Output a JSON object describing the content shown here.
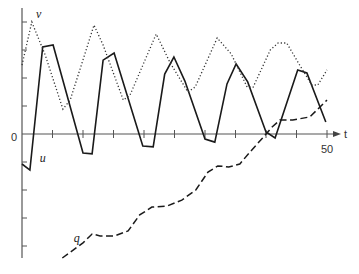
{
  "chart_data": {
    "type": "line",
    "title": "",
    "xlabel": "t",
    "ylabel": "",
    "xlim": [
      0,
      52
    ],
    "ylim": [
      -4.5,
      4.5
    ],
    "x_ticks": [
      5,
      10,
      15,
      20,
      25,
      30,
      35,
      40,
      45,
      50
    ],
    "x_tick_labels": [
      {
        "value": 50,
        "label": "50"
      }
    ],
    "y_ticks": [
      -4,
      -3,
      -2,
      -1,
      1,
      2,
      3,
      4
    ],
    "origin_label": "0",
    "grid": false,
    "legend": "inline labels",
    "series": [
      {
        "name": "u",
        "style": "solid",
        "label_at": [
          2.9,
          -1.0
        ],
        "points": [
          [
            0,
            -1.07
          ],
          [
            1.3,
            -1.29
          ],
          [
            3.4,
            3.11
          ],
          [
            5.1,
            3.18
          ],
          [
            10,
            -0.68
          ],
          [
            11.5,
            -0.71
          ],
          [
            13.3,
            2.64
          ],
          [
            15.1,
            2.89
          ],
          [
            19.8,
            -0.43
          ],
          [
            21.5,
            -0.46
          ],
          [
            23.4,
            2.14
          ],
          [
            24.9,
            2.75
          ],
          [
            26.7,
            1.89
          ],
          [
            30,
            -0.18
          ],
          [
            31.6,
            -0.29
          ],
          [
            33.6,
            1.79
          ],
          [
            35.1,
            2.5
          ],
          [
            37,
            1.86
          ],
          [
            40,
            0.07
          ],
          [
            41.5,
            -0.14
          ],
          [
            45.2,
            2.29
          ],
          [
            46.7,
            2.18
          ],
          [
            49.8,
            0.43
          ]
        ]
      },
      {
        "name": "v",
        "style": "dotted",
        "label_at": [
          2.3,
          4.15
        ],
        "points": [
          [
            0,
            2.46
          ],
          [
            1.6,
            4.0
          ],
          [
            3.8,
            2.82
          ],
          [
            6.7,
            0.89
          ],
          [
            7.9,
            1.21
          ],
          [
            11.8,
            3.89
          ],
          [
            13.3,
            3.18
          ],
          [
            16.6,
            1.21
          ],
          [
            17.7,
            1.39
          ],
          [
            22,
            3.57
          ],
          [
            24.3,
            2.54
          ],
          [
            27.2,
            1.5
          ],
          [
            28.4,
            1.68
          ],
          [
            32,
            3.43
          ],
          [
            34.3,
            2.86
          ],
          [
            36.9,
            1.68
          ],
          [
            37.9,
            1.68
          ],
          [
            40.7,
            3.0
          ],
          [
            42,
            3.25
          ],
          [
            43.4,
            3.25
          ],
          [
            45.6,
            2.43
          ],
          [
            47.5,
            1.75
          ],
          [
            48.5,
            1.75
          ],
          [
            50,
            2.29
          ]
        ]
      },
      {
        "name": "q",
        "style": "dashed",
        "label_at": [
          8.5,
          -3.85
        ],
        "points": [
          [
            6.6,
            -4.43
          ],
          [
            10,
            -3.89
          ],
          [
            11.5,
            -3.57
          ],
          [
            12.8,
            -3.64
          ],
          [
            15.2,
            -3.64
          ],
          [
            17.4,
            -3.46
          ],
          [
            19.3,
            -2.89
          ],
          [
            21.3,
            -2.61
          ],
          [
            23.8,
            -2.57
          ],
          [
            26.2,
            -2.36
          ],
          [
            28.5,
            -2.0
          ],
          [
            30.5,
            -1.36
          ],
          [
            32.1,
            -1.14
          ],
          [
            33.9,
            -1.18
          ],
          [
            35.7,
            -1.07
          ],
          [
            37.4,
            -0.64
          ],
          [
            39.3,
            -0.18
          ],
          [
            41,
            0.25
          ],
          [
            42.3,
            0.5
          ],
          [
            44.4,
            0.5
          ],
          [
            47.2,
            0.61
          ],
          [
            50,
            1.21
          ]
        ]
      }
    ]
  }
}
